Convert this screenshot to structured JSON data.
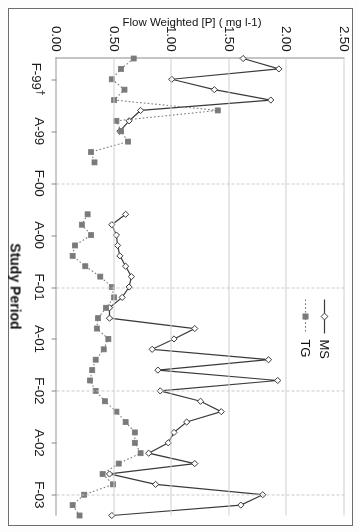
{
  "figure": {
    "orientation_note": "printed-upside-down",
    "legend": {
      "entries": [
        {
          "label": "MS",
          "icon": "solid-line-diamond-marker",
          "color": "#3a3a3a",
          "style": "solid"
        },
        {
          "label": "TG",
          "icon": "dotted-line-square-marker",
          "color": "#7a7a7a",
          "style": "dotted"
        }
      ]
    }
  },
  "chart_data": {
    "type": "line",
    "title": "",
    "xlabel": "Study Period",
    "ylabel": "Flow Weighted [P] ( mg l-1)",
    "ylim": [
      0.0,
      2.5
    ],
    "yticks": [
      0.0,
      0.5,
      1.0,
      1.5,
      2.0,
      2.5
    ],
    "ytick_labels": [
      "0.00",
      "0.50",
      "1.00",
      "1.50",
      "2.00",
      "2.50"
    ],
    "grid": "horizontal-solid-plus-vertical-dashed-at-majors",
    "legend_position": "upper-left",
    "xtick_labels": [
      "F-99†",
      "A-99",
      "F-00",
      "A-00",
      "F-01",
      "A-01",
      "F-02",
      "A-02",
      "F-03"
    ],
    "xtick_positions": [
      2,
      7,
      12,
      17,
      22,
      27,
      32,
      37,
      42
    ],
    "x": [
      0,
      1,
      2,
      3,
      4,
      5,
      6,
      7,
      8,
      9,
      10,
      11,
      12,
      13,
      14,
      15,
      16,
      17,
      18,
      19,
      20,
      21,
      22,
      23,
      24,
      25,
      26,
      27,
      28,
      29,
      30,
      31,
      32,
      33,
      34,
      35,
      36,
      37,
      38,
      39,
      40,
      41,
      42,
      43,
      44
    ],
    "series": [
      {
        "name": "MS",
        "style": "solid",
        "marker": "diamond",
        "color": "#3a3a3a",
        "values": [
          1.62,
          1.93,
          1.0,
          1.37,
          1.86,
          0.73,
          0.63,
          0.55,
          null,
          null,
          null,
          null,
          null,
          null,
          null,
          0.6,
          0.48,
          0.52,
          0.53,
          0.55,
          0.6,
          0.65,
          0.63,
          0.57,
          0.46,
          0.46,
          1.2,
          1.02,
          0.83,
          1.84,
          0.88,
          1.92,
          0.9,
          1.25,
          1.43,
          1.13,
          1.02,
          0.97,
          0.8,
          1.2,
          0.46,
          0.86,
          1.79,
          1.6,
          0.48
        ]
      },
      {
        "name": "TG",
        "style": "dotted",
        "marker": "square",
        "color": "#7a7a7a",
        "values": [
          0.67,
          0.56,
          0.48,
          0.59,
          0.5,
          1.4,
          0.52,
          0.56,
          0.62,
          0.3,
          0.33,
          null,
          null,
          null,
          null,
          0.27,
          0.22,
          0.3,
          0.16,
          0.14,
          0.25,
          0.38,
          0.48,
          0.5,
          0.43,
          0.36,
          0.35,
          0.45,
          0.41,
          0.34,
          0.31,
          0.29,
          0.34,
          0.42,
          0.52,
          0.6,
          0.68,
          0.68,
          0.73,
          0.54,
          0.4,
          0.49,
          0.24,
          0.14,
          0.2
        ]
      }
    ]
  }
}
